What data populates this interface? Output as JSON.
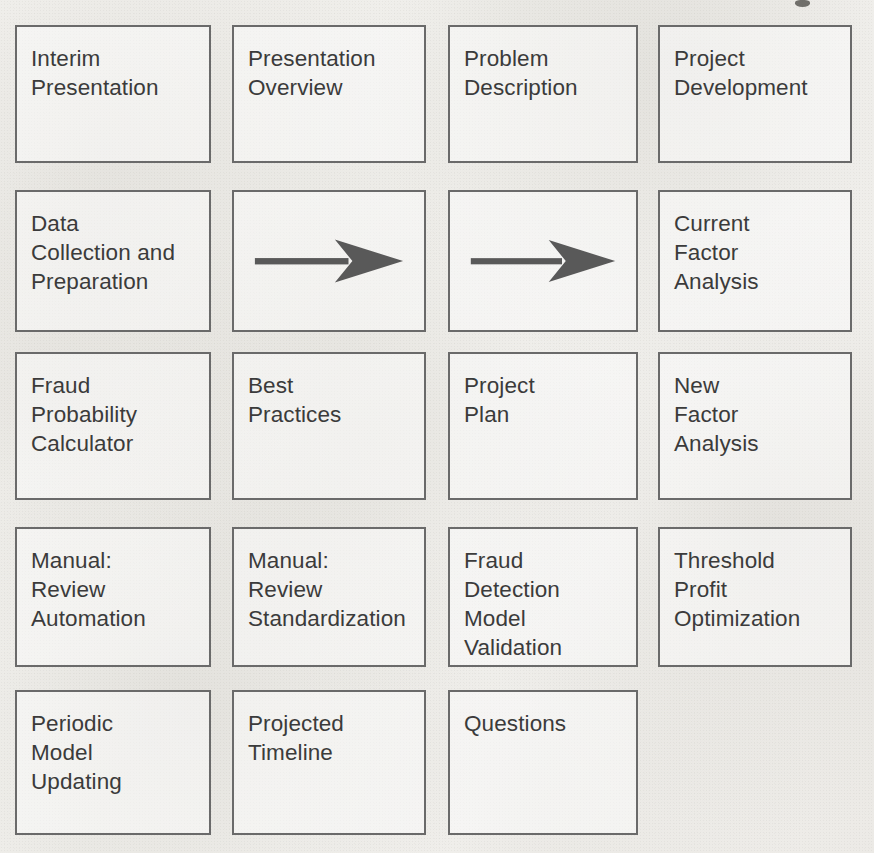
{
  "page": {
    "kind": "scanned-diagram",
    "width": 874,
    "height": 853,
    "box_border_color": "#6a6a6a",
    "text_color": "#3b3b3b",
    "arrow_color": "#595959",
    "paper_color": "#f3f2ef"
  },
  "diagram": {
    "type": "grid-of-boxes",
    "columns": 4,
    "rows": 5,
    "nodes": [
      {
        "id": "n1",
        "row": 1,
        "col": 1,
        "kind": "box",
        "label": "Interim\nPresentation"
      },
      {
        "id": "n2",
        "row": 1,
        "col": 2,
        "kind": "box",
        "label": "Presentation\nOverview"
      },
      {
        "id": "n3",
        "row": 1,
        "col": 3,
        "kind": "box",
        "label": "Problem\nDescription"
      },
      {
        "id": "n4",
        "row": 1,
        "col": 4,
        "kind": "box",
        "label": "Project\nDevelopment"
      },
      {
        "id": "n5",
        "row": 2,
        "col": 1,
        "kind": "box",
        "label": "Data\nCollection and\nPreparation"
      },
      {
        "id": "n6",
        "row": 2,
        "col": 2,
        "kind": "arrow",
        "label": ""
      },
      {
        "id": "n7",
        "row": 2,
        "col": 3,
        "kind": "arrow",
        "label": ""
      },
      {
        "id": "n8",
        "row": 2,
        "col": 4,
        "kind": "box",
        "label": "Current\nFactor\nAnalysis"
      },
      {
        "id": "n9",
        "row": 3,
        "col": 1,
        "kind": "box",
        "label": "Fraud\nProbability\nCalculator"
      },
      {
        "id": "n10",
        "row": 3,
        "col": 2,
        "kind": "box",
        "label": "Best\nPractices"
      },
      {
        "id": "n11",
        "row": 3,
        "col": 3,
        "kind": "box",
        "label": "Project\nPlan"
      },
      {
        "id": "n12",
        "row": 3,
        "col": 4,
        "kind": "box",
        "label": "New\nFactor\nAnalysis"
      },
      {
        "id": "n13",
        "row": 4,
        "col": 1,
        "kind": "box",
        "label": "Manual:\nReview\nAutomation"
      },
      {
        "id": "n14",
        "row": 4,
        "col": 2,
        "kind": "box",
        "label": "Manual:\nReview\nStandardization"
      },
      {
        "id": "n15",
        "row": 4,
        "col": 3,
        "kind": "box",
        "label": "Fraud\nDetection\nModel\nValidation"
      },
      {
        "id": "n16",
        "row": 4,
        "col": 4,
        "kind": "box",
        "label": "Threshold\nProfit\nOptimization"
      },
      {
        "id": "n17",
        "row": 5,
        "col": 1,
        "kind": "box",
        "label": "Periodic\nModel\nUpdating"
      },
      {
        "id": "n18",
        "row": 5,
        "col": 2,
        "kind": "box",
        "label": "Projected\nTimeline"
      },
      {
        "id": "n19",
        "row": 5,
        "col": 3,
        "kind": "box",
        "label": "Questions"
      }
    ],
    "arrow_icons": [
      {
        "id": "a1",
        "name": "right-arrow-icon",
        "direction": "right"
      },
      {
        "id": "a2",
        "name": "right-arrow-icon",
        "direction": "right"
      }
    ]
  }
}
